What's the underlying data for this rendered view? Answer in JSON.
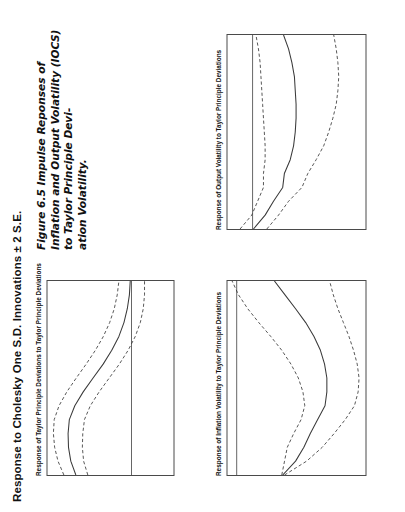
{
  "page": {
    "figure_title": "Response to Cholesky One S.D. Innovations ± 2 S.E.",
    "caption_line1": "Figure 6.5 Impulse Reponses of Inflation and Output Volatility (IOCS) to Taylor Principle Devi-",
    "caption_line2": "ation Volatility."
  },
  "chart_data": [
    {
      "type": "line",
      "title": "Response of Taylor Principle Deviations to Taylor Principle Deviations",
      "xlabel": "",
      "ylabel": "",
      "xlim": [
        1,
        15
      ],
      "ylim": [
        -0.2,
        0.4
      ],
      "xticks": [
        2,
        4,
        6,
        8,
        10,
        12,
        14
      ],
      "yticks": [
        ".4",
        ".3",
        ".2",
        ".1",
        ".0",
        "-.1",
        "-.2"
      ],
      "ytick_values": [
        0.4,
        0.3,
        0.2,
        0.1,
        0.0,
        -0.1,
        -0.2
      ],
      "grid": false,
      "legend": "none",
      "zero_line": 0.0,
      "x": [
        1,
        2,
        3,
        4,
        5,
        6,
        7,
        8,
        9,
        10,
        11,
        12,
        13,
        14,
        15
      ],
      "series": [
        {
          "name": "impulse response",
          "style": "solid",
          "values": [
            0.265,
            0.289,
            0.3,
            0.302,
            0.296,
            0.27,
            0.23,
            0.183,
            0.135,
            0.094,
            0.06,
            0.036,
            0.02,
            0.01,
            0.006
          ]
        },
        {
          "name": "upper 2 S.E. band",
          "style": "dashed",
          "values": [
            0.322,
            0.35,
            0.366,
            0.372,
            0.368,
            0.345,
            0.308,
            0.263,
            0.216,
            0.172,
            0.134,
            0.104,
            0.082,
            0.068,
            0.06
          ]
        },
        {
          "name": "lower 2 S.E. band",
          "style": "dashed",
          "values": [
            0.208,
            0.228,
            0.234,
            0.232,
            0.224,
            0.196,
            0.154,
            0.106,
            0.058,
            0.016,
            -0.018,
            -0.042,
            -0.056,
            -0.062,
            -0.062
          ]
        }
      ]
    },
    {
      "type": "line",
      "title": "Response of Inflation Volatility to Taylor Principle Deviations",
      "xlabel": "",
      "ylabel": "",
      "xlim": [
        1,
        15
      ],
      "ylim": [
        -0.28,
        0.02
      ],
      "xticks": [
        2,
        4,
        6,
        8,
        10,
        12,
        14
      ],
      "yticks": [
        ".00",
        "-.05",
        "-.10",
        "-.15",
        "-.20",
        "-.25"
      ],
      "ytick_values": [
        0.0,
        -0.05,
        -0.1,
        -0.15,
        -0.2,
        -0.25
      ],
      "grid": false,
      "legend": "none",
      "zero_line": 0.0,
      "x": [
        1,
        2,
        3,
        4,
        5,
        6,
        7,
        8,
        9,
        10,
        11,
        12,
        13,
        14,
        15
      ],
      "series": [
        {
          "name": "impulse response",
          "style": "solid",
          "values": [
            -0.1,
            -0.128,
            -0.146,
            -0.16,
            -0.176,
            -0.192,
            -0.196,
            -0.196,
            -0.191,
            -0.182,
            -0.168,
            -0.15,
            -0.128,
            -0.105,
            -0.082
          ]
        },
        {
          "name": "upper 2 S.E. band",
          "style": "dashed",
          "values": [
            -0.098,
            -0.104,
            -0.11,
            -0.124,
            -0.14,
            -0.148,
            -0.144,
            -0.134,
            -0.118,
            -0.098,
            -0.074,
            -0.048,
            -0.024,
            -0.004,
            0.01
          ]
        },
        {
          "name": "lower 2 S.E. band",
          "style": "dashed",
          "values": [
            -0.104,
            -0.152,
            -0.186,
            -0.212,
            -0.236,
            -0.256,
            -0.264,
            -0.266,
            -0.262,
            -0.254,
            -0.244,
            -0.232,
            -0.22,
            -0.21,
            -0.202
          ]
        }
      ]
    },
    {
      "type": "line",
      "title": "Response of Output Volatility to Taylor Principle Deviations",
      "xlabel": "",
      "ylabel": "",
      "xlim": [
        1,
        15
      ],
      "ylim": [
        -0.27,
        0.06
      ],
      "xticks": [
        2,
        4,
        6,
        8,
        10,
        12,
        14
      ],
      "yticks": [
        ".05",
        ".00",
        "-.05",
        "-.10",
        "-.15",
        "-.20",
        "-.25"
      ],
      "ytick_values": [
        0.05,
        0.0,
        -0.05,
        -0.1,
        -0.15,
        -0.2,
        -0.25
      ],
      "grid": false,
      "legend": "none",
      "zero_line": 0.0,
      "x": [
        1,
        2,
        3,
        4,
        5,
        6,
        7,
        8,
        9,
        10,
        11,
        12,
        13,
        14,
        15
      ],
      "series": [
        {
          "name": "impulse response",
          "style": "solid",
          "values": [
            -0.002,
            -0.03,
            -0.05,
            -0.072,
            -0.076,
            -0.09,
            -0.098,
            -0.102,
            -0.104,
            -0.104,
            -0.102,
            -0.1,
            -0.094,
            -0.086,
            -0.074
          ]
        },
        {
          "name": "upper 2 S.E. band",
          "style": "dashed",
          "values": [
            0.03,
            0.002,
            -0.012,
            -0.026,
            -0.026,
            -0.03,
            -0.03,
            -0.028,
            -0.026,
            -0.024,
            -0.022,
            -0.02,
            -0.018,
            -0.014,
            -0.008
          ]
        },
        {
          "name": "lower 2 S.E. band",
          "style": "dashed",
          "values": [
            -0.034,
            -0.062,
            -0.086,
            -0.118,
            -0.132,
            -0.152,
            -0.17,
            -0.182,
            -0.192,
            -0.2,
            -0.204,
            -0.206,
            -0.204,
            -0.2,
            -0.194
          ]
        }
      ]
    }
  ]
}
